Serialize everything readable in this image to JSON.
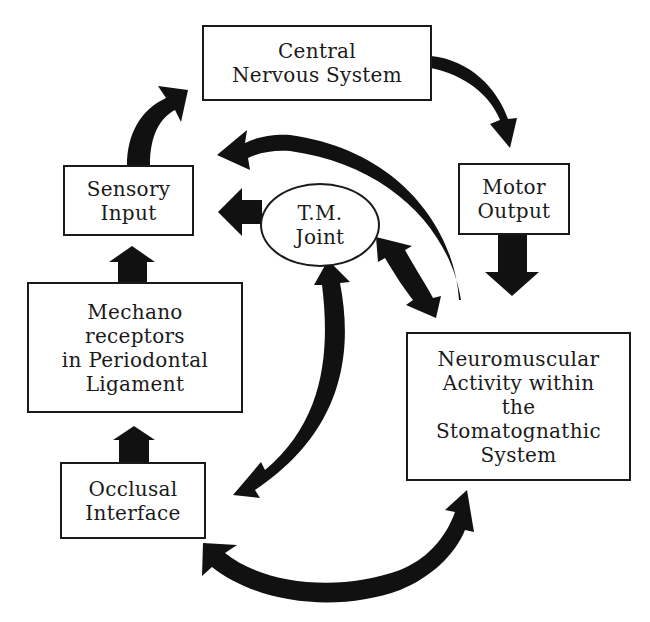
{
  "diagram": {
    "nodes": {
      "cns": {
        "lines": [
          "Central",
          "Nervous System"
        ]
      },
      "motor_output": {
        "lines": [
          "Motor",
          "Output"
        ]
      },
      "neuromuscular": {
        "lines": [
          "Neuromuscular",
          "Activity within",
          "the",
          "Stomatognathic",
          "System"
        ]
      },
      "occlusal": {
        "lines": [
          "Occlusal",
          "Interface"
        ]
      },
      "mechano": {
        "lines": [
          "Mechano",
          "receptors",
          "in Periodontal",
          "Ligament"
        ]
      },
      "sensory_input": {
        "lines": [
          "Sensory",
          "Input"
        ]
      },
      "tm_joint": {
        "lines": [
          "T.M.",
          "Joint"
        ]
      }
    },
    "edges": [
      {
        "from": "Sensory Input",
        "to": "Central Nervous System",
        "type": "curved-arrow"
      },
      {
        "from": "Central Nervous System",
        "to": "Motor Output",
        "type": "curved-arrow"
      },
      {
        "from": "Motor Output",
        "to": "Neuromuscular Activity within the Stomatognathic System",
        "type": "straight-arrow"
      },
      {
        "from": "Neuromuscular Activity within the Stomatognathic System",
        "to": "Sensory Input",
        "type": "long-curved-arrow"
      },
      {
        "from": "T.M. Joint",
        "to": "Neuromuscular Activity within the Stomatognathic System",
        "type": "double-arrow"
      },
      {
        "from": "T.M. Joint",
        "to": "Occlusal Interface",
        "type": "curved-double-arrow"
      },
      {
        "from": "Occlusal Interface",
        "to": "Neuromuscular Activity within the Stomatognathic System",
        "type": "curved-double-arrow"
      },
      {
        "from": "T.M. Joint",
        "to": "Sensory Input",
        "type": "straight-arrow"
      },
      {
        "from": "Occlusal Interface",
        "to": "Mechano receptors in Periodontal Ligament",
        "type": "straight-arrow"
      },
      {
        "from": "Mechano receptors in Periodontal Ligament",
        "to": "Sensory Input",
        "type": "straight-arrow"
      }
    ],
    "colors": {
      "ink": "#1a1a1a",
      "background": "#ffffff"
    }
  }
}
